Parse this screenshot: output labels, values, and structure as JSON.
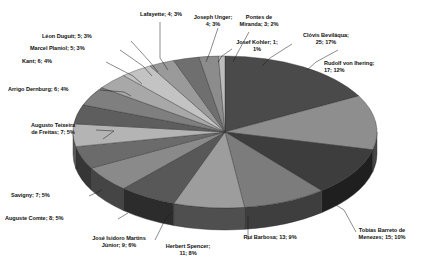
{
  "chart_data": {
    "type": "pie",
    "title": "",
    "subtitle": "",
    "xlabel": "",
    "ylabel": "",
    "legend_position": "none",
    "grid": false,
    "three_d": true,
    "total": 145,
    "label_format": "name; count; percent",
    "categories": [
      "Clóvis Beviláqua",
      "Rudolf von Ihering",
      "Tobias Barreto de Menezes",
      "Rui Barbosa",
      "Herbert Spencer",
      "José Isidoro Martins Júnior",
      "Auguste Comte",
      "Savigny",
      "Augusto Teixeira de Freitas",
      "Arrigo Dernburg",
      "Kant",
      "Marcel Planiol",
      "Léon Duguit",
      "Lafayette",
      "Joseph Unger",
      "Pontes de Miranda",
      "Josef Kohler"
    ],
    "values": [
      25,
      17,
      15,
      13,
      11,
      9,
      8,
      7,
      7,
      6,
      6,
      5,
      5,
      4,
      4,
      3,
      1
    ],
    "percents": [
      17,
      12,
      10,
      9,
      8,
      6,
      5,
      5,
      5,
      4,
      4,
      3,
      3,
      3,
      3,
      2,
      1
    ],
    "colors": [
      "#4a4a4a",
      "#8e8e8e",
      "#3d3d3d",
      "#7c7c7c",
      "#9d9d9d",
      "#585858",
      "#8a8a8a",
      "#6b6b6b",
      "#b4b4b4",
      "#5e5e5e",
      "#7f7f7f",
      "#a8a8a8",
      "#c3c3c3",
      "#9a9a9a",
      "#6f6f6f",
      "#8c8c8c",
      "#bdbdbd"
    ],
    "slices": [
      {
        "name": "Clóvis Beviláqua",
        "value": 25,
        "percent": 17,
        "label": "Clóvis Beviláqua;\n25; 17%"
      },
      {
        "name": "Rudolf von Ihering",
        "value": 17,
        "percent": 12,
        "label": "Rudolf von Ihering;\n17; 12%"
      },
      {
        "name": "Tobias Barreto de Menezes",
        "value": 15,
        "percent": 10,
        "label": "Tobias Barreto de\nMenezes; 15; 10%"
      },
      {
        "name": "Rui Barbosa",
        "value": 13,
        "percent": 9,
        "label": "Rui Barbosa; 13; 9%"
      },
      {
        "name": "Herbert Spencer",
        "value": 11,
        "percent": 8,
        "label": "Herbert Spencer;\n11; 8%"
      },
      {
        "name": "José Isidoro Martins Júnior",
        "value": 9,
        "percent": 6,
        "label": "José Isidoro Martins\nJúnior; 9; 6%"
      },
      {
        "name": "Auguste Comte",
        "value": 8,
        "percent": 5,
        "label": "Auguste Comte; 8; 5%"
      },
      {
        "name": "Savigny",
        "value": 7,
        "percent": 5,
        "label": "Savigny; 7; 5%"
      },
      {
        "name": "Augusto Teixeira de Freitas",
        "value": 7,
        "percent": 5,
        "label": "Augusto Teixeira\nde Freitas; 7; 5%"
      },
      {
        "name": "Arrigo Dernburg",
        "value": 6,
        "percent": 4,
        "label": "Arrigo Dernburg; 6; 4%"
      },
      {
        "name": "Kant",
        "value": 6,
        "percent": 4,
        "label": "Kant; 6; 4%"
      },
      {
        "name": "Marcel Planiol",
        "value": 5,
        "percent": 3,
        "label": "Marcel Planiol; 5; 3%"
      },
      {
        "name": "Léon Duguit",
        "value": 5,
        "percent": 3,
        "label": "Léon Duguit; 5; 3%"
      },
      {
        "name": "Lafayette",
        "value": 4,
        "percent": 3,
        "label": "Lafayette; 4; 3%"
      },
      {
        "name": "Joseph Unger",
        "value": 4,
        "percent": 3,
        "label": "Joseph Unger;\n4; 3%"
      },
      {
        "name": "Pontes de Miranda",
        "value": 3,
        "percent": 2,
        "label": "Pontes de\nMiranda; 3; 2%"
      },
      {
        "name": "Josef Kohler",
        "value": 1,
        "percent": 1,
        "label": "Josef Kohler; 1;\n1%"
      }
    ]
  },
  "labels": {
    "clovis": "Clóvis Beviláqua;\n25; 17%",
    "ihering": "Rudolf von Ihering;\n17; 12%",
    "tobias": "Tobias Barreto de\nMenezes; 15; 10%",
    "rui": "Rui Barbosa; 13; 9%",
    "spencer": "Herbert Spencer;\n11; 8%",
    "martins": "José Isidoro Martins\nJúnior; 9; 6%",
    "comte": "Auguste Comte; 8; 5%",
    "savigny": "Savigny; 7; 5%",
    "freitas": "Augusto Teixeira\nde Freitas; 7; 5%",
    "dernburg": "Arrigo Dernburg; 6; 4%",
    "kant": "Kant; 6; 4%",
    "planiol": "Marcel Planiol; 5; 3%",
    "duguit": "Léon Duguit; 5; 3%",
    "lafayette": "Lafayette; 4; 3%",
    "unger": "Joseph Unger;\n4; 3%",
    "pontes": "Pontes de\nMiranda; 3; 2%",
    "kohler": "Josef Kohler; 1;\n1%"
  }
}
